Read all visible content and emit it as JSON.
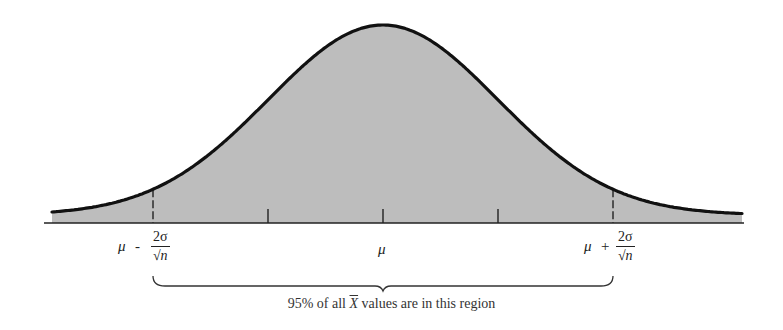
{
  "figure": {
    "type": "normal_distribution_diagram",
    "colors": {
      "fill": "#bdbdbd",
      "curve": "#111111",
      "axis": "#222222",
      "background": "#ffffff"
    },
    "labels": {
      "left_mu": "μ",
      "left_op": "-",
      "left_num": "2σ",
      "left_den_sym": "√",
      "left_den_var": "n",
      "center_mu": "μ",
      "right_mu": "μ",
      "right_op": "+",
      "right_num": "2σ",
      "right_den_sym": "√",
      "right_den_var": "n"
    },
    "caption": {
      "pre": "95% of all ",
      "var": "X",
      "post": " values are in this region"
    }
  },
  "chart_data": {
    "type": "area",
    "title": "",
    "x_ticks": [
      "μ - 2σ/√n",
      "μ - σ/√n",
      "μ",
      "μ + σ/√n",
      "μ + 2σ/√n"
    ],
    "x_tick_labels_shown": [
      "μ - 2σ/√n",
      "μ",
      "μ + 2σ/√n"
    ],
    "x_range_sd": [
      -2.9,
      3.1
    ],
    "shaded_region": "entire area under curve",
    "annotation": "95% of all X̄ values are in this region",
    "annotation_span": [
      "μ - 2σ/√n",
      "μ + 2σ/√n"
    ],
    "grid": false,
    "legend": null
  }
}
